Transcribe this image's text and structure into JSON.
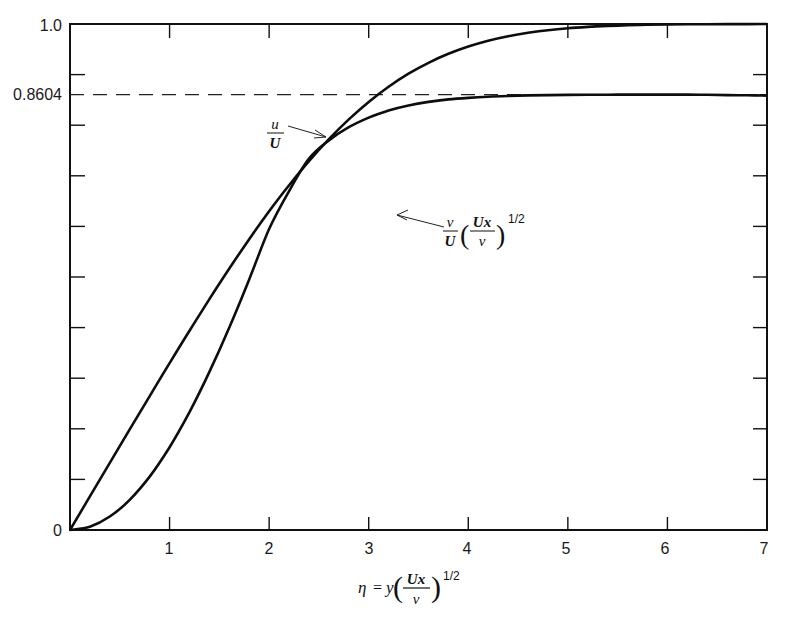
{
  "chart_data": {
    "type": "line",
    "title": "",
    "xlabel": "η = y(Ux/ν)^1/2",
    "ylabel": "",
    "xlim": [
      0,
      7
    ],
    "ylim": [
      0,
      1.0
    ],
    "grid": false,
    "x_ticks": [
      0,
      1,
      2,
      3,
      4,
      5,
      6,
      7
    ],
    "x_tick_labels": [
      "",
      "1",
      "2",
      "3",
      "4",
      "5",
      "6",
      "7"
    ],
    "y_ticks": [
      0,
      0.1,
      0.2,
      0.3,
      0.4,
      0.5,
      0.6,
      0.7,
      0.8,
      0.9,
      1.0
    ],
    "y_tick_labels_shown": [
      {
        "value": 0,
        "label": "0"
      },
      {
        "value": 0.8604,
        "label": "0.8604"
      },
      {
        "value": 1.0,
        "label": "1.0"
      }
    ],
    "reference_lines": [
      {
        "orientation": "horizontal",
        "value": 0.8604,
        "style": "dashed",
        "label": "0.8604"
      }
    ],
    "x": [
      0,
      0.2,
      0.4,
      0.6,
      0.8,
      1.0,
      1.2,
      1.4,
      1.6,
      1.8,
      2.0,
      2.2,
      2.4,
      2.6,
      2.8,
      3.0,
      3.2,
      3.4,
      3.6,
      3.8,
      4.0,
      4.2,
      4.4,
      4.6,
      4.8,
      5.0,
      5.2,
      5.4,
      5.6,
      5.8,
      6.0,
      6.2,
      6.4,
      6.6,
      6.8,
      7.0
    ],
    "series": [
      {
        "name": "u/U",
        "label_parts": {
          "numerator": "u",
          "denominator": "U"
        },
        "values": [
          0,
          0.0664,
          0.1328,
          0.1989,
          0.2647,
          0.3298,
          0.3938,
          0.4563,
          0.5168,
          0.5748,
          0.6298,
          0.6813,
          0.729,
          0.7725,
          0.8115,
          0.8461,
          0.8761,
          0.9018,
          0.9233,
          0.9411,
          0.9555,
          0.967,
          0.9759,
          0.9827,
          0.9878,
          0.9916,
          0.9943,
          0.9962,
          0.9975,
          0.9984,
          0.999,
          0.9994,
          0.9996,
          0.9998,
          0.9999,
          1.0
        ]
      },
      {
        "name": "v/U (Ux/ν)^1/2",
        "label_parts": {
          "numerator": "v",
          "denominator": "U",
          "factor_num": "Ux",
          "factor_den": "ν",
          "exponent": "1/2"
        },
        "values": [
          0,
          0.0066,
          0.0266,
          0.0597,
          0.1056,
          0.1637,
          0.233,
          0.3124,
          0.4004,
          0.4952,
          0.5949,
          0.67,
          0.734,
          0.77,
          0.796,
          0.815,
          0.829,
          0.839,
          0.846,
          0.851,
          0.854,
          0.8563,
          0.8578,
          0.8589,
          0.8595,
          0.8599,
          0.8601,
          0.8603,
          0.8604,
          0.8604,
          0.8604,
          0.8604,
          0.86,
          0.8595,
          0.859,
          0.8585
        ]
      }
    ],
    "annotations": [
      {
        "text": "u/U",
        "arrow_to_x": 2.6,
        "series": "u/U"
      },
      {
        "text": "v/U (Ux/ν)^1/2",
        "arrow_to_x": 3.25,
        "series": "v/U (Ux/ν)^1/2"
      }
    ]
  },
  "axis": {
    "y_label_top": "1.0",
    "y_label_ref": "0.8604",
    "y_label_zero": "0",
    "x_labels": [
      "1",
      "2",
      "3",
      "4",
      "5",
      "6",
      "7"
    ],
    "xlabel_eta": "η",
    "xlabel_eq": "=",
    "xlabel_y": "y",
    "xlabel_num": "Ux",
    "xlabel_den": "ν",
    "xlabel_exp": "1/2"
  },
  "legend": {
    "u_num": "u",
    "u_den": "U",
    "v_num": "v",
    "v_den": "U",
    "v_factor_num": "Ux",
    "v_factor_den": "ν",
    "v_exp": "1/2"
  }
}
